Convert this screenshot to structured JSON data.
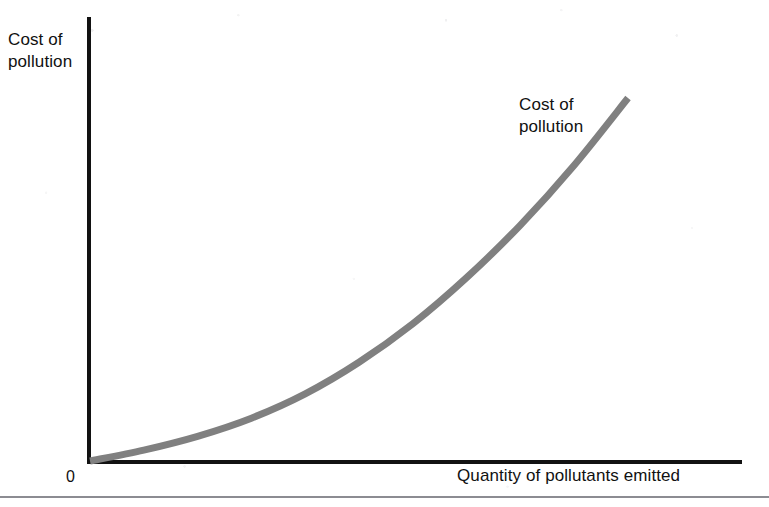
{
  "figure": {
    "background_color": "#ffffff",
    "axis_color": "#121212",
    "curve_color": "#808080",
    "rule_color": "#8c8c92",
    "origin_label": "0"
  },
  "chart_data": {
    "type": "line",
    "title": "",
    "subtitle": "",
    "xlabel": "Quantity of pollutants emitted",
    "ylabel": "Cost of\npollution",
    "ylabel_lines": [
      "Cost of",
      "pollution"
    ],
    "xlabel_lines": [
      "Quantity of pollutants emitted"
    ],
    "grid": false,
    "legend_position": "none",
    "axis_ticks": {
      "x": [],
      "y": [],
      "origin": "0"
    },
    "xlim": [
      0,
      1
    ],
    "ylim": [
      0,
      1
    ],
    "annotations": [
      {
        "text": "Cost of\npollution",
        "lines": [
          "Cost of",
          "pollution"
        ],
        "x": 0.66,
        "y": 0.82,
        "target": "cost-of-pollution-curve"
      }
    ],
    "series": [
      {
        "name": "Cost of pollution",
        "color": "#808080",
        "line_width_px": 7,
        "shape": "convex-increasing",
        "points": [
          {
            "x": 0.0,
            "y": 0.0
          },
          {
            "x": 0.1,
            "y": 0.03
          },
          {
            "x": 0.2,
            "y": 0.068
          },
          {
            "x": 0.3,
            "y": 0.118
          },
          {
            "x": 0.4,
            "y": 0.185
          },
          {
            "x": 0.5,
            "y": 0.272
          },
          {
            "x": 0.6,
            "y": 0.378
          },
          {
            "x": 0.7,
            "y": 0.505
          },
          {
            "x": 0.8,
            "y": 0.65
          },
          {
            "x": 0.9,
            "y": 0.815
          },
          {
            "x": 1.0,
            "y": 1.0
          }
        ]
      }
    ]
  }
}
